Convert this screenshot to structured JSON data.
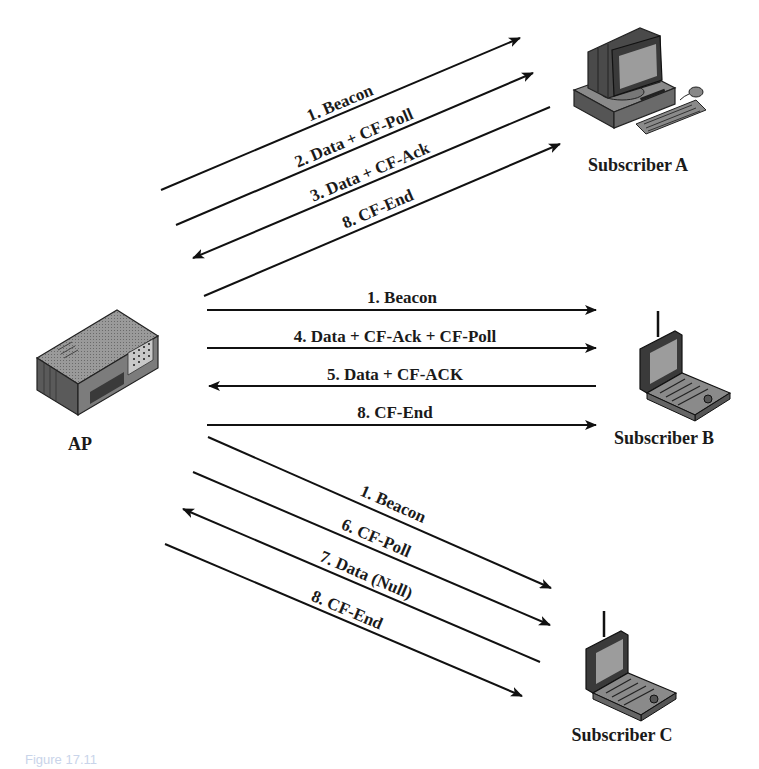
{
  "nodes": {
    "ap": {
      "label": "AP",
      "icon": "access-point-icon"
    },
    "subscriber_a": {
      "label": "Subscriber A",
      "icon": "desktop-computer-icon"
    },
    "subscriber_b": {
      "label": "Subscriber B",
      "icon": "wireless-laptop-icon"
    },
    "subscriber_c": {
      "label": "Subscriber C",
      "icon": "wireless-laptop-icon"
    }
  },
  "flows": {
    "to_a": [
      {
        "label": "1. Beacon",
        "direction": "AP→A"
      },
      {
        "label": "2. Data + CF-Poll",
        "direction": "AP→A"
      },
      {
        "label": "3. Data + CF-Ack",
        "direction": "A→AP"
      },
      {
        "label": "8. CF-End",
        "direction": "AP→A"
      }
    ],
    "to_b": [
      {
        "label": "1. Beacon",
        "direction": "AP→B"
      },
      {
        "label": "4. Data + CF-Ack + CF-Poll",
        "direction": "AP→B"
      },
      {
        "label": "5. Data + CF-ACK",
        "direction": "B→AP"
      },
      {
        "label": "8. CF-End",
        "direction": "AP→B"
      }
    ],
    "to_c": [
      {
        "label": "1. Beacon",
        "direction": "AP→C"
      },
      {
        "label": "6. CF-Poll",
        "direction": "AP→C"
      },
      {
        "label": "7. Data (Null)",
        "direction": "C→AP"
      },
      {
        "label": "8. CF-End",
        "direction": "AP→C"
      }
    ]
  },
  "caption": "Figure 17.11"
}
